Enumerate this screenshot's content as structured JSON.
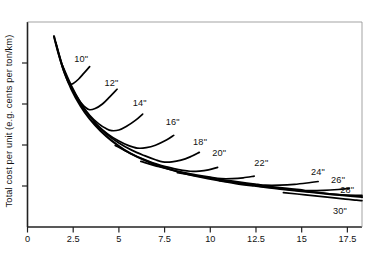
{
  "chart_data": {
    "type": "line",
    "title": "",
    "subtitle": "",
    "xlabel": "",
    "ylabel": "Total cost per unit (e.g. cents per ton/km)",
    "xlim": [
      0,
      18.3
    ],
    "ylim": [
      0,
      1
    ],
    "grid": false,
    "legend": "none",
    "annotations_note": "Each curve is labelled in-plot with its pipe diameter in inches; the lower common boundary is the envelope of minimum total cost.",
    "x_ticks": [
      "0",
      "2.5",
      "5",
      "7.5",
      "10",
      "12.5",
      "15",
      "17.5"
    ],
    "x_tick_values": [
      0,
      2.5,
      5,
      7.5,
      10,
      12.5,
      15,
      17.5
    ],
    "y_ticks": [
      "",
      "",
      "",
      ""
    ],
    "y_tick_values": [
      0.2,
      0.4,
      0.6,
      0.8
    ],
    "y_ticks_unlabeled": true,
    "line_color": "#000000",
    "background_color": "#ffffff",
    "axis_color": "#222222",
    "series": [
      {
        "name": "10\"",
        "label": "10\"",
        "label_x": 3.05,
        "label_y": 0.815,
        "min_x": 2.3,
        "min_y": 0.697,
        "points": [
          [
            1.45,
            0.93
          ],
          [
            1.6,
            0.878
          ],
          [
            1.8,
            0.812
          ],
          [
            2.0,
            0.755
          ],
          [
            2.2,
            0.712
          ],
          [
            2.3,
            0.697
          ],
          [
            2.5,
            0.7
          ],
          [
            2.8,
            0.722
          ],
          [
            3.1,
            0.752
          ],
          [
            3.4,
            0.782
          ]
        ]
      },
      {
        "name": "12\"",
        "label": "12\"",
        "label_x": 4.7,
        "label_y": 0.7,
        "min_x": 3.35,
        "min_y": 0.573,
        "points": [
          [
            1.55,
            0.9
          ],
          [
            1.9,
            0.79
          ],
          [
            2.3,
            0.7
          ],
          [
            2.7,
            0.636
          ],
          [
            3.0,
            0.598
          ],
          [
            3.35,
            0.573
          ],
          [
            3.7,
            0.578
          ],
          [
            4.1,
            0.6
          ],
          [
            4.5,
            0.635
          ],
          [
            4.9,
            0.672
          ]
        ]
      },
      {
        "name": "14\"",
        "label": "14\"",
        "label_x": 6.25,
        "label_y": 0.6,
        "min_x": 4.6,
        "min_y": 0.47,
        "points": [
          [
            1.9,
            0.79
          ],
          [
            2.4,
            0.69
          ],
          [
            2.9,
            0.608
          ],
          [
            3.4,
            0.545
          ],
          [
            3.9,
            0.503
          ],
          [
            4.3,
            0.48
          ],
          [
            4.6,
            0.47
          ],
          [
            5.0,
            0.473
          ],
          [
            5.4,
            0.49
          ],
          [
            5.9,
            0.52
          ],
          [
            6.3,
            0.551
          ]
        ]
      },
      {
        "name": "16\"",
        "label": "16\"",
        "label_x": 8.05,
        "label_y": 0.508,
        "min_x": 6.0,
        "min_y": 0.385,
        "points": [
          [
            2.6,
            0.64
          ],
          [
            3.2,
            0.562
          ],
          [
            3.8,
            0.5
          ],
          [
            4.4,
            0.453
          ],
          [
            5.0,
            0.419
          ],
          [
            5.5,
            0.398
          ],
          [
            6.0,
            0.385
          ],
          [
            6.5,
            0.387
          ],
          [
            7.0,
            0.399
          ],
          [
            7.6,
            0.424
          ],
          [
            8.0,
            0.447
          ]
        ]
      },
      {
        "name": "18\"",
        "label": "18\"",
        "label_x": 9.55,
        "label_y": 0.41,
        "min_x": 7.4,
        "min_y": 0.318,
        "points": [
          [
            3.6,
            0.512
          ],
          [
            4.3,
            0.455
          ],
          [
            5.0,
            0.41
          ],
          [
            5.7,
            0.375
          ],
          [
            6.4,
            0.348
          ],
          [
            7.0,
            0.328
          ],
          [
            7.4,
            0.318
          ],
          [
            7.9,
            0.318
          ],
          [
            8.4,
            0.326
          ],
          [
            8.9,
            0.342
          ],
          [
            9.4,
            0.364
          ]
        ]
      },
      {
        "name": "20\"",
        "label": "20\"",
        "label_x": 10.6,
        "label_y": 0.355,
        "min_x": 8.9,
        "min_y": 0.272,
        "points": [
          [
            4.8,
            0.398
          ],
          [
            5.6,
            0.36
          ],
          [
            6.4,
            0.329
          ],
          [
            7.2,
            0.303
          ],
          [
            8.0,
            0.285
          ],
          [
            8.5,
            0.276
          ],
          [
            8.9,
            0.272
          ],
          [
            9.4,
            0.273
          ],
          [
            9.9,
            0.279
          ],
          [
            10.4,
            0.291
          ]
        ]
      },
      {
        "name": "22\"",
        "label": "22\"",
        "label_x": 12.9,
        "label_y": 0.307,
        "min_x": 10.6,
        "min_y": 0.236,
        "points": [
          [
            6.2,
            0.32
          ],
          [
            7.2,
            0.294
          ],
          [
            8.2,
            0.272
          ],
          [
            9.2,
            0.255
          ],
          [
            10.0,
            0.243
          ],
          [
            10.6,
            0.236
          ],
          [
            11.2,
            0.236
          ],
          [
            11.8,
            0.24
          ],
          [
            12.4,
            0.248
          ]
        ]
      },
      {
        "name": "24\"",
        "label": "24\"",
        "label_x": 16.0,
        "label_y": 0.262,
        "min_x": 13.0,
        "min_y": 0.204,
        "points": [
          [
            8.2,
            0.265
          ],
          [
            9.5,
            0.246
          ],
          [
            10.8,
            0.229
          ],
          [
            12.0,
            0.214
          ],
          [
            12.6,
            0.208
          ],
          [
            13.0,
            0.204
          ],
          [
            13.8,
            0.204
          ],
          [
            14.6,
            0.208
          ],
          [
            15.4,
            0.216
          ],
          [
            15.9,
            0.222
          ]
        ]
      },
      {
        "name": "26\"",
        "label": "26\"",
        "label_x": 17.1,
        "label_y": 0.222,
        "min_x": 15.3,
        "min_y": 0.178,
        "points": [
          [
            10.5,
            0.226
          ],
          [
            11.8,
            0.212
          ],
          [
            13.0,
            0.2
          ],
          [
            14.2,
            0.188
          ],
          [
            15.0,
            0.181
          ],
          [
            15.3,
            0.178
          ],
          [
            16.2,
            0.179
          ],
          [
            17.0,
            0.183
          ],
          [
            17.6,
            0.188
          ]
        ]
      },
      {
        "name": "28\"",
        "label": "28\"",
        "label_x": 17.6,
        "label_y": 0.175,
        "min_x": 17.6,
        "min_y": 0.154,
        "points": [
          [
            12.5,
            0.2
          ],
          [
            13.8,
            0.188
          ],
          [
            15.0,
            0.176
          ],
          [
            16.2,
            0.165
          ],
          [
            17.2,
            0.157
          ],
          [
            18.0,
            0.154
          ],
          [
            18.3,
            0.154
          ]
        ]
      },
      {
        "name": "30\"",
        "label": "30\"",
        "label_x": 17.2,
        "label_y": 0.075,
        "min_x": 18.3,
        "min_y": 0.128,
        "points": [
          [
            14.0,
            0.168
          ],
          [
            15.2,
            0.157
          ],
          [
            16.4,
            0.146
          ],
          [
            17.4,
            0.136
          ],
          [
            18.0,
            0.131
          ],
          [
            18.3,
            0.128
          ]
        ]
      }
    ],
    "envelope": {
      "name": "minimum-cost envelope",
      "points": [
        [
          1.45,
          0.93
        ],
        [
          1.7,
          0.845
        ],
        [
          2.0,
          0.76
        ],
        [
          2.4,
          0.672
        ],
        [
          2.9,
          0.59
        ],
        [
          3.4,
          0.527
        ],
        [
          4.0,
          0.468
        ],
        [
          4.6,
          0.421
        ],
        [
          5.3,
          0.376
        ],
        [
          6.0,
          0.342
        ],
        [
          6.8,
          0.311
        ],
        [
          7.6,
          0.286
        ],
        [
          8.5,
          0.263
        ],
        [
          9.4,
          0.245
        ],
        [
          10.4,
          0.228
        ],
        [
          11.4,
          0.213
        ],
        [
          12.4,
          0.201
        ],
        [
          13.5,
          0.189
        ],
        [
          14.6,
          0.178
        ],
        [
          15.7,
          0.168
        ],
        [
          16.8,
          0.158
        ],
        [
          17.8,
          0.15
        ],
        [
          18.3,
          0.146
        ]
      ]
    }
  },
  "axes": {
    "y_axis_title": "Total cost per unit (e.g. cents per ton/km)",
    "x_tick_labels": [
      "0",
      "2.5",
      "5",
      "7.5",
      "10",
      "12.5",
      "15",
      "17.5"
    ]
  },
  "curve_labels": [
    "10\"",
    "12\"",
    "14\"",
    "16\"",
    "18\"",
    "20\"",
    "22\"",
    "24\"",
    "26\"",
    "28\"",
    "30\""
  ]
}
